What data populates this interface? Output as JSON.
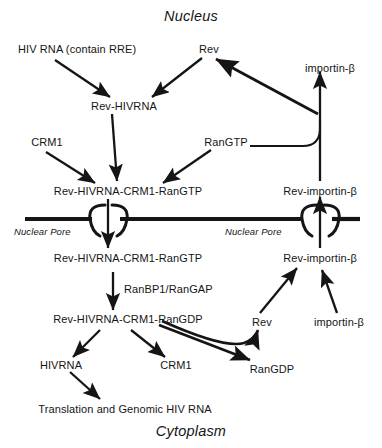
{
  "figure": {
    "compartments": {
      "top": "Nucleus",
      "bottom": "Cytoplasm"
    },
    "pore_label_left": "Nuclear Pore",
    "pore_label_right": "Nuclear Pore",
    "colors": {
      "ink": "#151515",
      "background": "#ffffff"
    }
  },
  "nodes": {
    "hiv_rna": "HIV RNA (contain RRE)",
    "rev_top": "Rev",
    "importin_b_top": "importin-β",
    "rev_hivrna": "Rev-HIVRNA",
    "crm1_nuc": "CRM1",
    "rangtp": "RanGTP",
    "complex_gtp_nuc": "Rev-HIVRNA-CRM1-RanGTP",
    "rev_importin_nuc": "Rev-importin-β",
    "complex_gtp_cyt": "Rev-HIVRNA-CRM1-RanGTP",
    "rev_importin_cyt": "Rev-importin-β",
    "ranbp1_rangap": "RanBP1/RanGAP",
    "complex_gdp_cyt": "Rev-HIVRNA-CRM1-RanGDP",
    "rev_cyt": "Rev",
    "importin_b_cyt": "importin-β",
    "hivrna_cyt": "HIVRNA",
    "crm1_cyt": "CRM1",
    "rangdp_cyt": "RanGDP",
    "translation": "Translation and Genomic HIV RNA"
  }
}
